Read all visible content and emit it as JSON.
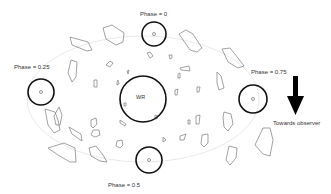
{
  "diagram": {
    "central_star": {
      "label": "WR",
      "cx": 143,
      "cy": 99,
      "r": 23
    },
    "orbit": {
      "cx": 143,
      "cy": 99,
      "rx": 116,
      "ry": 63,
      "color": "#dddddd"
    },
    "companions": [
      {
        "id": "phase-0",
        "label": "Phase = 0",
        "cx": 154,
        "cy": 34,
        "r": 12,
        "label_x": 140,
        "label_y": 11
      },
      {
        "id": "phase-0.25",
        "label": "Phase = 0.25",
        "cx": 41,
        "cy": 92,
        "r": 13,
        "label_x": 14,
        "label_y": 64
      },
      {
        "id": "phase-0.5",
        "label": "Phase = 0.5",
        "cx": 149,
        "cy": 160,
        "r": 13,
        "label_x": 108,
        "label_y": 182
      },
      {
        "id": "phase-0.75",
        "label": "Phase = 0.75",
        "cx": 253,
        "cy": 99,
        "r": 14,
        "label_x": 251,
        "label_y": 69
      }
    ],
    "direction_arrow": {
      "label": "Towards observer",
      "color": "#000000"
    },
    "clump_color": "#777777",
    "stroke_color": "#111111"
  }
}
